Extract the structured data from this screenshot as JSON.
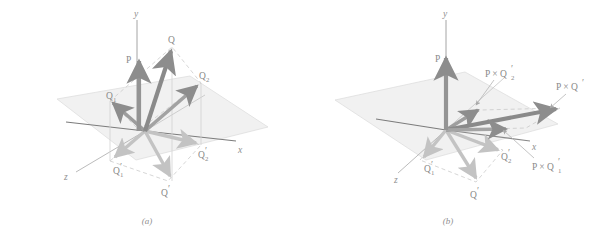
{
  "figure": {
    "background": "#ffffff",
    "plane_fill": "#f0f0f0",
    "plane_stroke": "#dcdcdc",
    "axis_color": "#8a8a8a",
    "vector_dark": "#8d8d8d",
    "vector_light": "#c6c6c6",
    "label_color": "#8f8f8f",
    "dashed_color": "#c9c9c9"
  },
  "panels": [
    {
      "id": "a",
      "caption": "(a)",
      "axes": [
        {
          "name": "y-axis",
          "label": "y"
        },
        {
          "name": "x-axis",
          "label": "x"
        },
        {
          "name": "z-axis",
          "label": "z"
        }
      ],
      "vectors": [
        {
          "name": "P",
          "label": "P",
          "shade": "dark"
        },
        {
          "name": "Q",
          "label": "Q",
          "shade": "dark"
        },
        {
          "name": "Q1",
          "label": "Q",
          "subscript": "1",
          "prime": "",
          "shade": "dark"
        },
        {
          "name": "Q2",
          "label": "Q",
          "subscript": "2",
          "prime": "",
          "shade": "dark"
        },
        {
          "name": "Q-prime",
          "label": "Q",
          "subscript": "",
          "prime": "'",
          "shade": "light"
        },
        {
          "name": "Q1-prime",
          "label": "Q",
          "subscript": "1",
          "prime": "'",
          "shade": "light"
        },
        {
          "name": "Q2-prime",
          "label": "Q",
          "subscript": "2",
          "prime": "'",
          "shade": "light"
        }
      ]
    },
    {
      "id": "b",
      "caption": "(b)",
      "axes": [
        {
          "name": "y-axis",
          "label": "y"
        },
        {
          "name": "x-axis",
          "label": "x"
        },
        {
          "name": "z-axis",
          "label": "z"
        }
      ],
      "vectors": [
        {
          "name": "P",
          "label": "P",
          "shade": "dark"
        },
        {
          "name": "P-cross-Q2-prime",
          "label": "P × Q",
          "subscript": "2",
          "prime": "'",
          "shade": "dark"
        },
        {
          "name": "P-cross-Q-prime",
          "label": "P × Q",
          "subscript": "",
          "prime": "'",
          "shade": "dark"
        },
        {
          "name": "P-cross-Q1-prime",
          "label": "P × Q",
          "subscript": "1",
          "prime": "'",
          "shade": "dark"
        },
        {
          "name": "Q-prime",
          "label": "Q",
          "subscript": "",
          "prime": "'",
          "shade": "light"
        },
        {
          "name": "Q1-prime",
          "label": "Q",
          "subscript": "1",
          "prime": "'",
          "shade": "light"
        },
        {
          "name": "Q2-prime",
          "label": "Q",
          "subscript": "2",
          "prime": "'",
          "shade": "light"
        }
      ]
    }
  ],
  "labels": {
    "y": "y",
    "x": "x",
    "z": "z",
    "P": "P",
    "Q": "Q",
    "Qsub1": "1",
    "Qsub2": "2",
    "prime": "′",
    "PcrossQ": "P × Q",
    "caption_a": "(a)",
    "caption_b": "(b)"
  }
}
